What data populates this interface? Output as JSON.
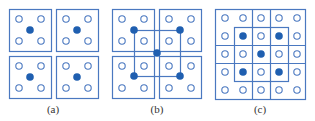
{
  "colors": {
    "line": "#4a78c0",
    "filled_dot": "#1f5fb0",
    "hollow_dot_stroke": "#4a78c0",
    "label": "#333333"
  },
  "panels": [
    {
      "id": "a",
      "label": "(a)",
      "label_pos": [
        53,
        113
      ],
      "boxes": [
        [
          9,
          9,
          42,
          42
        ],
        [
          56,
          9,
          42,
          42
        ],
        [
          9,
          56,
          42,
          42
        ],
        [
          56,
          56,
          42,
          42
        ]
      ],
      "hollow_points": [
        [
          19,
          19
        ],
        [
          41,
          19
        ],
        [
          19,
          41
        ],
        [
          41,
          41
        ],
        [
          66,
          19
        ],
        [
          88,
          19
        ],
        [
          66,
          41
        ],
        [
          88,
          41
        ],
        [
          19,
          66
        ],
        [
          41,
          66
        ],
        [
          19,
          88
        ],
        [
          41,
          88
        ],
        [
          66,
          66
        ],
        [
          88,
          66
        ],
        [
          66,
          88
        ],
        [
          88,
          88
        ]
      ],
      "filled_points": [
        [
          30,
          30
        ],
        [
          77,
          30
        ],
        [
          30,
          77
        ],
        [
          77,
          77
        ]
      ]
    },
    {
      "id": "b",
      "label": "(b)",
      "label_pos": [
        157,
        113
      ],
      "boxes": [
        [
          112,
          9,
          42,
          42
        ],
        [
          159,
          9,
          42,
          42
        ],
        [
          112,
          56,
          42,
          42
        ],
        [
          159,
          56,
          42,
          42
        ],
        [
          134,
          30,
          46,
          46
        ]
      ],
      "hollow_points": [
        [
          122,
          19
        ],
        [
          144,
          19
        ],
        [
          122,
          41
        ],
        [
          144,
          41
        ],
        [
          169,
          19
        ],
        [
          191,
          19
        ],
        [
          169,
          41
        ],
        [
          191,
          41
        ],
        [
          122,
          66
        ],
        [
          144,
          66
        ],
        [
          122,
          88
        ],
        [
          144,
          88
        ],
        [
          169,
          66
        ],
        [
          191,
          66
        ],
        [
          169,
          88
        ],
        [
          191,
          88
        ]
      ],
      "filled_points": [
        [
          134,
          30
        ],
        [
          180,
          30
        ],
        [
          134,
          76
        ],
        [
          180,
          76
        ],
        [
          157,
          53
        ]
      ]
    },
    {
      "id": "c",
      "label": "(c)",
      "label_pos": [
        260,
        113
      ],
      "boxes": [
        [
          215,
          9,
          90,
          90
        ],
        [
          234,
          27,
          54,
          54
        ]
      ],
      "vlines": [
        [
          252,
          9,
          252,
          99
        ],
        [
          270,
          9,
          270,
          99
        ]
      ],
      "hlines": [
        [
          215,
          45,
          305,
          45
        ],
        [
          215,
          63,
          305,
          63
        ]
      ],
      "hollow_points": [
        [
          225,
          18
        ],
        [
          243,
          18
        ],
        [
          261,
          18
        ],
        [
          279,
          18
        ],
        [
          297,
          18
        ],
        [
          225,
          36
        ],
        [
          261,
          36
        ],
        [
          297,
          36
        ],
        [
          225,
          54
        ],
        [
          243,
          54
        ],
        [
          279,
          54
        ],
        [
          297,
          54
        ],
        [
          225,
          72
        ],
        [
          261,
          72
        ],
        [
          297,
          72
        ],
        [
          225,
          90
        ],
        [
          243,
          90
        ],
        [
          261,
          90
        ],
        [
          279,
          90
        ],
        [
          297,
          90
        ]
      ],
      "filled_points": [
        [
          243,
          36
        ],
        [
          279,
          36
        ],
        [
          261,
          54
        ],
        [
          243,
          72
        ],
        [
          279,
          72
        ]
      ]
    }
  ]
}
